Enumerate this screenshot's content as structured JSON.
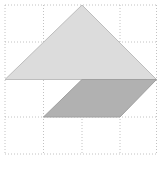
{
  "figure": {
    "width": 162,
    "height": 171,
    "background_color": "#ffffff",
    "grid": {
      "x_lines": [
        5,
        43.5,
        82,
        120,
        156.5
      ],
      "y_lines": [
        5,
        42,
        79.5,
        117,
        154
      ],
      "line_color": "#b3b3b3",
      "dash_pattern": "1 2",
      "line_width": 0.8
    },
    "shapes": [
      {
        "name": "large-triangle",
        "type": "polygon",
        "points": [
          [
            82,
            5
          ],
          [
            156.5,
            79.5
          ],
          [
            5,
            79.5
          ]
        ],
        "fill": "#dcdcdc",
        "stroke": "#bdbdbd",
        "stroke_width": 1
      },
      {
        "name": "parallelogram",
        "type": "polygon",
        "points": [
          [
            82,
            79.5
          ],
          [
            156.5,
            79.5
          ],
          [
            120,
            117
          ],
          [
            43.5,
            117
          ]
        ],
        "fill": "#b1b1b1",
        "stroke": "#9f9f9f",
        "stroke_width": 1
      }
    ]
  }
}
